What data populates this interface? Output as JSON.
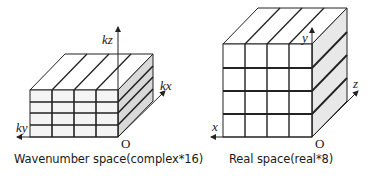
{
  "figure": {
    "type": "diagram"
  },
  "left_panel": {
    "caption": "Wavenumber space(complex*16)",
    "axes": {
      "vertical": "kz",
      "depth": "kx",
      "horizontal": "ky",
      "origin": "O"
    },
    "grid": {
      "rows": 4,
      "cols": 4,
      "slab_orientation": "horizontal (kz slices)"
    },
    "colors": {
      "front": "#f5f5f5",
      "top": "#ffffff",
      "side": "#d9d9d9",
      "line": "#222222"
    }
  },
  "right_panel": {
    "caption": "Real space(real*8)",
    "axes": {
      "vertical": "y",
      "depth": "z",
      "horizontal": "x",
      "origin": "O"
    },
    "grid": {
      "rows": 4,
      "cols": 4,
      "slab_orientation": "cube"
    },
    "colors": {
      "front": "#ffffff",
      "top": "#ffffff",
      "side": "#e6e6e6",
      "line": "#222222"
    }
  }
}
